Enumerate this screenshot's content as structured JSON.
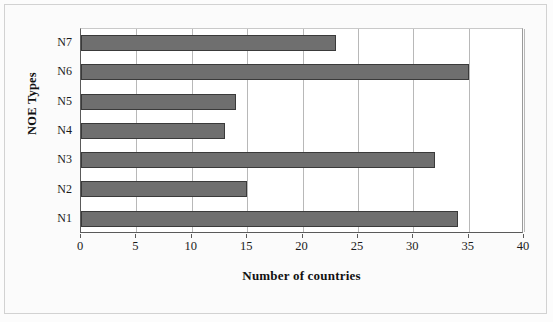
{
  "chart_data": {
    "type": "bar",
    "orientation": "horizontal",
    "title": "",
    "xlabel": "Number of countries",
    "ylabel": "NOE Types",
    "categories": [
      "N1",
      "N2",
      "N3",
      "N4",
      "N5",
      "N6",
      "N7"
    ],
    "values": [
      34,
      15,
      32,
      13,
      14,
      35,
      23
    ],
    "series": [
      {
        "name": "Number of countries",
        "values": [
          34,
          15,
          32,
          13,
          14,
          35,
          23
        ]
      }
    ],
    "xlim": [
      0,
      40
    ],
    "xticks": [
      0,
      5,
      10,
      15,
      20,
      25,
      30,
      35,
      40
    ],
    "xtick_labels": [
      "0",
      "5",
      "10",
      "15",
      "20",
      "25",
      "30",
      "35",
      "40"
    ],
    "ytick_labels": [
      "N7",
      "N6",
      "N5",
      "N4",
      "N3",
      "N2",
      "N1"
    ],
    "grid": "vertical",
    "legend": "none",
    "bar_color": "#6f6f6f",
    "bar_edge_color": "#3a3a3a",
    "gridline_color": "#b8b8b8",
    "axis_color": "#5a5a5a",
    "plot_background": "#ffffff",
    "figure_background": "#fbfbfb"
  }
}
